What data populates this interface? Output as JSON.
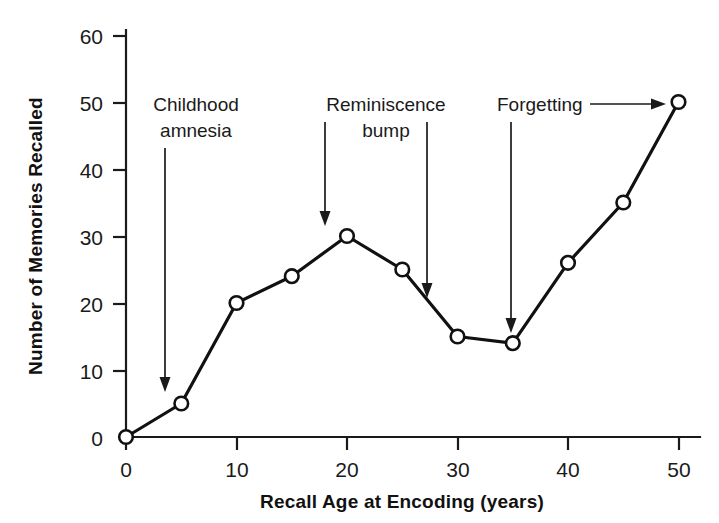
{
  "chart_data": {
    "type": "line",
    "title": "",
    "xlabel": "Recall Age at Encoding (years)",
    "ylabel": "Number of Memories Recalled",
    "xlim": [
      0,
      52
    ],
    "ylim": [
      0,
      62
    ],
    "xticks": [
      0,
      10,
      20,
      30,
      40,
      50
    ],
    "yticks": [
      0,
      10,
      20,
      30,
      40,
      50,
      60
    ],
    "xtick_labels": [
      "0",
      "10",
      "20",
      "30",
      "40",
      "50"
    ],
    "ytick_labels": [
      "0",
      "10",
      "20",
      "30",
      "40",
      "50",
      "60"
    ],
    "grid": false,
    "legend": null,
    "marker": "open-circle",
    "series": [
      {
        "name": "Memories recalled",
        "x": [
          0,
          5,
          10,
          15,
          20,
          25,
          30,
          35,
          40,
          45,
          50
        ],
        "values": [
          0,
          5,
          20,
          24,
          30,
          25,
          15,
          14,
          26,
          35,
          50
        ]
      }
    ],
    "annotations": [
      {
        "id": "childhood-amnesia",
        "lines": [
          "Childhood",
          "amnesia"
        ],
        "text": "Childhood amnesia",
        "arrow": "down",
        "target_x": 3.5,
        "target_y": 7
      },
      {
        "id": "reminiscence-bump",
        "lines": [
          "Reminiscence",
          "bump"
        ],
        "text": "Reminiscence bump",
        "arrow": "down-pair",
        "target_x_left": 18,
        "target_y_left": 31,
        "target_x_right": 27,
        "target_y_right": 22
      },
      {
        "id": "forgetting",
        "lines": [
          "Forgetting"
        ],
        "text": "Forgetting",
        "arrow": "down-and-right",
        "target_x": 35,
        "target_y": 16,
        "target_x_right": 50,
        "target_y_right": 50
      }
    ]
  },
  "axes": {
    "x_title": "Recall Age at Encoding (years)",
    "y_title": "Number of Memories Recalled"
  },
  "labels": {
    "y_60": "60",
    "y_50": "50",
    "y_40": "40",
    "y_30": "30",
    "y_20": "20",
    "y_10": "10",
    "y_0": "0",
    "x_0": "0",
    "x_10": "10",
    "x_20": "20",
    "x_30": "30",
    "x_40": "40",
    "x_50": "50"
  },
  "annotation_text": {
    "childhood_line1": "Childhood",
    "childhood_line2": "amnesia",
    "reminiscence_line1": "Reminiscence",
    "reminiscence_line2": "bump",
    "forgetting_line1": "Forgetting"
  },
  "colors": {
    "ink": "#111111",
    "background": "#ffffff",
    "marker_fill": "#ffffff"
  }
}
